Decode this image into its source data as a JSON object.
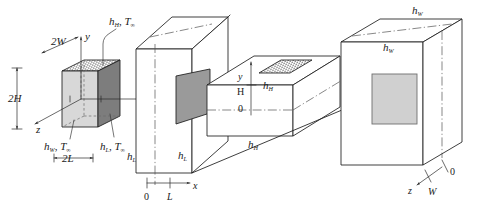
{
  "figure": {
    "background_color": "#ffffff",
    "line_color": "#1c1c1c"
  },
  "colors": {
    "face_light_gray": "#d8d8d8",
    "face_mid_gray": "#9a9a9a",
    "face_dark_gray": "#7d7d7d",
    "face_white": "#ffffff",
    "inner_square_gray": "#d0d0d0",
    "centerline_gray": "#555555"
  },
  "labels": {
    "block": {
      "height_dim": "2H",
      "width_dim": "2W",
      "length_dim": "2L",
      "axis_x": "x",
      "axis_y": "y",
      "axis_z": "z",
      "top_conv": "h",
      "top_conv_sub": "H",
      "top_conv_temp": "T",
      "top_conv_temp_sub": "∞",
      "front_conv": "h",
      "front_conv_sub": "W",
      "front_conv_temp": "T",
      "front_conv_temp_sub": "∞",
      "right_conv": "h",
      "right_conv_sub": "L",
      "right_conv_temp": "T",
      "right_conv_temp_sub": "∞"
    },
    "wall_l": {
      "conv_left": "h",
      "conv_left_sub": "L",
      "conv_right": "h",
      "conv_right_sub": "L",
      "axis_origin": "0",
      "axis_tick": "L",
      "axis_name": "x"
    },
    "wall_h": {
      "conv_top": "h",
      "conv_top_sub": "H",
      "conv_bottom": "h",
      "conv_bottom_sub": "H",
      "axis_origin": "0",
      "axis_tick": "H",
      "axis_name": "y"
    },
    "wall_w": {
      "conv_outer": "h",
      "conv_outer_sub": "W",
      "conv_inner": "h",
      "conv_inner_sub": "W",
      "axis_origin": "0",
      "axis_tick": "W",
      "axis_name": "z"
    }
  }
}
